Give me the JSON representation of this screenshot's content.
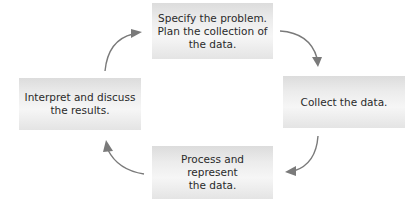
{
  "diagram": {
    "type": "cycle",
    "direction": "clockwise",
    "colors": {
      "box_fill_light": "#f6f6f6",
      "box_fill_dark": "#dcdcdc",
      "arrow": "#7a7a7a",
      "text": "#2a2a2a"
    },
    "steps": [
      {
        "position": "top",
        "lines": [
          "Specify the problem.",
          "Plan the collection of",
          "the data."
        ]
      },
      {
        "position": "right",
        "lines": [
          "Collect the data."
        ]
      },
      {
        "position": "bottom",
        "lines": [
          "Process and represent",
          "the data."
        ]
      },
      {
        "position": "left",
        "lines": [
          "Interpret and discuss",
          "the results."
        ]
      }
    ],
    "arrows": [
      {
        "from": "top",
        "to": "right"
      },
      {
        "from": "right",
        "to": "bottom"
      },
      {
        "from": "bottom",
        "to": "left"
      },
      {
        "from": "left",
        "to": "top"
      }
    ]
  }
}
